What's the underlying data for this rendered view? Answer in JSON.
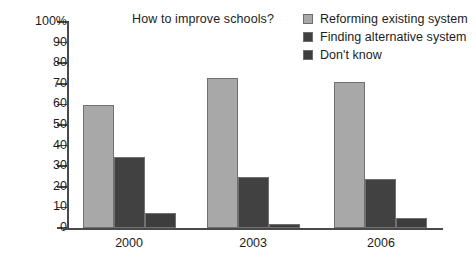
{
  "chart_data": {
    "type": "bar",
    "title": "How to improve schools?",
    "xlabel": "",
    "ylabel": "",
    "ylim": [
      0,
      100
    ],
    "grid": false,
    "legend_position": "top-right",
    "categories": [
      "2000",
      "2003",
      "2006"
    ],
    "y_ticks": [
      "100%",
      "90",
      "80",
      "70",
      "60",
      "50",
      "40",
      "30",
      "20",
      "10",
      "0"
    ],
    "y_tick_values": [
      100,
      90,
      80,
      70,
      60,
      50,
      40,
      30,
      20,
      10,
      0
    ],
    "series": [
      {
        "name": "Reforming existing system",
        "color": "#a8a8a8",
        "values": [
          59.5,
          73,
          71
        ]
      },
      {
        "name": "Finding alternative system",
        "color": "#414141",
        "values": [
          34.5,
          25,
          24
        ]
      },
      {
        "name": "Don't know",
        "color": "#3d3d3d",
        "values": [
          7.5,
          2,
          5
        ]
      }
    ]
  },
  "legend": {
    "items": [
      {
        "label": "Reforming existing system",
        "swatch": "#a8a8a8"
      },
      {
        "label": "Finding alternative system",
        "swatch": "#414141"
      },
      {
        "label": "Don't know",
        "swatch": "#3d3d3d"
      }
    ]
  },
  "axis": {
    "y_labels": [
      "100%",
      "90",
      "80",
      "70",
      "60",
      "50",
      "40",
      "30",
      "20",
      "10",
      "0"
    ],
    "x_labels": [
      "2000",
      "2003",
      "2006"
    ]
  }
}
